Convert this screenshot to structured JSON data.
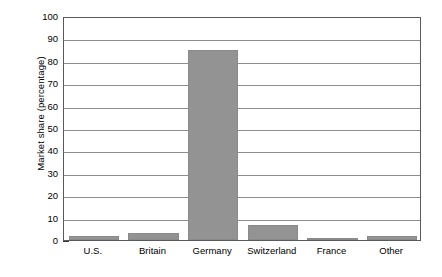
{
  "chart_data": {
    "type": "bar",
    "title": "",
    "xlabel": "",
    "ylabel": "Market share (percentage)",
    "categories": [
      "U.S.",
      "Britain",
      "Germany",
      "Switzerland",
      "France",
      "Other"
    ],
    "values": [
      2,
      3,
      85,
      6.5,
      1,
      2
    ],
    "ylim": [
      0,
      100
    ],
    "ytick_step": 10,
    "yticks": [
      0,
      10,
      20,
      30,
      40,
      50,
      60,
      70,
      80,
      90,
      100
    ],
    "ytick_labels": [
      "0",
      "10",
      "20",
      "30",
      "40",
      "50",
      "60",
      "70",
      "80",
      "90",
      "100"
    ],
    "minor_tick_step": 2,
    "grid": "horizontal",
    "legend": "none",
    "bar_color": "#939393",
    "gridline_color": "#8d8d8d",
    "axis_color": "#5a5a5a",
    "text_color": "#000000",
    "background_color": "#ffffff"
  }
}
